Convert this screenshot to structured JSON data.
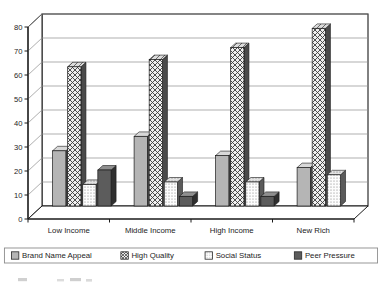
{
  "chart_data": {
    "type": "bar",
    "title": "",
    "subtitle": "",
    "xlabel": "",
    "ylabel": "",
    "categories": [
      "Low Income",
      "Middle Income",
      "High Income",
      "New Rich"
    ],
    "series": [
      {
        "name": "Brand Name Appeal",
        "values": [
          23,
          29,
          21,
          16
        ],
        "pattern": "solid-light-gray",
        "color": "#b3b3b3"
      },
      {
        "name": "High Quality",
        "values": [
          58,
          61,
          66,
          74
        ],
        "pattern": "diagonal-crosshatch",
        "color": "#e8e8e8"
      },
      {
        "name": "Social Status",
        "values": [
          9,
          10,
          10,
          13
        ],
        "pattern": "fine-dots-white",
        "color": "#fbfbfb"
      },
      {
        "name": "Peer Pressure",
        "values": [
          15,
          4,
          4,
          0
        ],
        "pattern": "solid-dark-gray",
        "color": "#5a5a5a"
      }
    ],
    "ylim": [
      0,
      80
    ],
    "yticks": [
      0,
      10,
      20,
      30,
      40,
      50,
      60,
      70,
      80
    ],
    "ytick_labels": [
      "0",
      "10",
      "20",
      "30",
      "40",
      "50",
      "60",
      "70",
      "80"
    ],
    "grid": true,
    "grid_axis": "y",
    "legend_position": "bottom",
    "style": "3d-columns-grayscale"
  },
  "legend": {
    "items": [
      {
        "label": "Brand Name Appeal",
        "swatch": "swatch-brand-name-appeal"
      },
      {
        "label": "High Quality",
        "swatch": "swatch-high-quality"
      },
      {
        "label": "Social Status",
        "swatch": "swatch-social-status"
      },
      {
        "label": "Peer Pressure",
        "swatch": "swatch-peer-pressure"
      }
    ]
  },
  "caption": {
    "text": ""
  },
  "colors": {
    "axis": "#1a1a1a",
    "gridline": "#8c8c8c",
    "plot_background": "#ffffff",
    "wall_top": "#ffffff",
    "floor": "#ffffff",
    "bar_front_light": "#b3b3b3",
    "bar_front_dark": "#5a5a5a",
    "bar_front_hatch": "#e8e8e8",
    "bar_front_dots": "#fbfbfb",
    "bar_side_shade": "#4a4a4a",
    "bar_top_shade": "#d6d6d6",
    "legend_border": "#8c8c8c"
  }
}
